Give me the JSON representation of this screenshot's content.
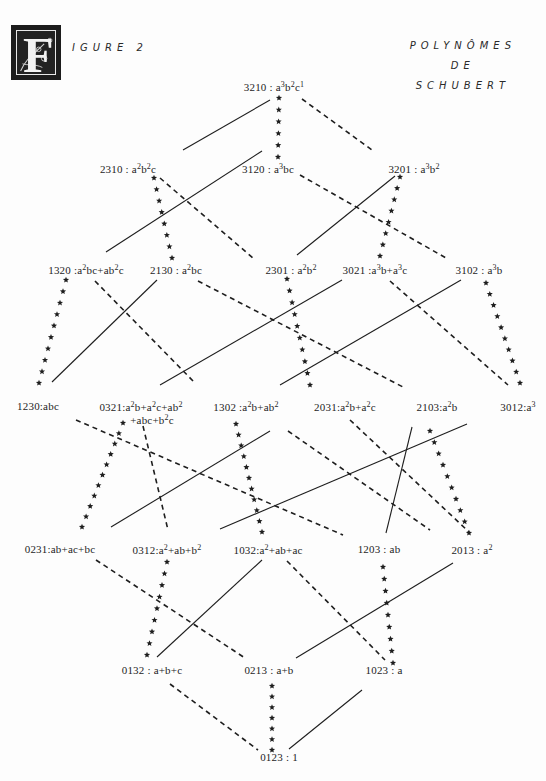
{
  "header": {
    "drop_cap_letter": "F",
    "figure_label": "IGURE  2",
    "title_lines": [
      "POLYNÔMES",
      "DE",
      "SCHUBERT"
    ]
  },
  "colors": {
    "ink": "#1e1e1e",
    "background": "#fdfdfd"
  },
  "nodes": [
    {
      "id": "3210",
      "x": 274,
      "y": 86,
      "html": "3210 : a<sup>3</sup>b<sup>2</sup>c<sup>1</sup>"
    },
    {
      "id": "2310",
      "x": 128,
      "y": 168,
      "html": "2310 : a<sup>2</sup>b<sup>2</sup>c"
    },
    {
      "id": "3120",
      "x": 268,
      "y": 168,
      "html": "3120 : a<sup>3</sup>bc"
    },
    {
      "id": "3201",
      "x": 414,
      "y": 168,
      "html": "3201 : a<sup>3</sup>b<sup>2</sup>"
    },
    {
      "id": "1320",
      "x": 86,
      "y": 269,
      "html": "1320 :a<sup>2</sup>bc+ab<sup>2</sup>c"
    },
    {
      "id": "2130",
      "x": 176,
      "y": 269,
      "html": "2130 : a<sup>2</sup>bc"
    },
    {
      "id": "2301",
      "x": 291,
      "y": 269,
      "html": "2301 : a<sup>2</sup>b<sup>2</sup>"
    },
    {
      "id": "3021",
      "x": 375,
      "y": 269,
      "html": "3021 :a<sup>3</sup>b+a<sup>3</sup>c"
    },
    {
      "id": "3102",
      "x": 479,
      "y": 269,
      "html": "3102 : a<sup>3</sup>b"
    },
    {
      "id": "1230",
      "x": 38,
      "y": 406,
      "html": "1230:abc"
    },
    {
      "id": "0321",
      "x": 141,
      "y": 406,
      "html": "0321:a<sup>2</sup>b+a<sup>2</sup>c+ab<sup>2</sup><span class=\"line2\">+abc+b<sup>2</sup>c</span>",
      "multiline": true
    },
    {
      "id": "1302",
      "x": 246,
      "y": 406,
      "html": "1302 :a<sup>2</sup>b+ab<sup>2</sup>"
    },
    {
      "id": "2031",
      "x": 345,
      "y": 406,
      "html": "2031:a<sup>2</sup>b+a<sup>2</sup>c"
    },
    {
      "id": "2103",
      "x": 437,
      "y": 406,
      "html": "2103:a<sup>2</sup>b"
    },
    {
      "id": "3012",
      "x": 518,
      "y": 406,
      "html": "3012:a<sup>3</sup>"
    },
    {
      "id": "0231",
      "x": 60,
      "y": 549,
      "html": "0231:ab+ac+bc"
    },
    {
      "id": "0312",
      "x": 167,
      "y": 549,
      "html": "0312:a<sup>2</sup>+ab+b<sup>2</sup>"
    },
    {
      "id": "1032",
      "x": 268,
      "y": 549,
      "html": "1032:a<sup>2</sup>+ab+ac"
    },
    {
      "id": "1203",
      "x": 379,
      "y": 549,
      "html": "1203 : ab"
    },
    {
      "id": "2013",
      "x": 472,
      "y": 549,
      "html": "2013 : a<sup>2</sup>"
    },
    {
      "id": "0132",
      "x": 152,
      "y": 670,
      "html": "0132 : a+b+c"
    },
    {
      "id": "0213",
      "x": 269,
      "y": 670,
      "html": "0213 : a+b"
    },
    {
      "id": "1023",
      "x": 384,
      "y": 670,
      "html": "1023 : a"
    },
    {
      "id": "0123",
      "x": 279,
      "y": 757,
      "html": "0123 : 1"
    }
  ],
  "edges": [
    {
      "type": "solid",
      "x1": 270,
      "y1": 100,
      "x2": 183,
      "y2": 150
    },
    {
      "type": "stars",
      "x1": 279,
      "y1": 98,
      "x2": 278,
      "y2": 157
    },
    {
      "type": "dashed",
      "x1": 302,
      "y1": 99,
      "x2": 372,
      "y2": 150
    },
    {
      "type": "stars",
      "x1": 154,
      "y1": 178,
      "x2": 172,
      "y2": 258
    },
    {
      "type": "dashed",
      "x1": 160,
      "y1": 178,
      "x2": 253,
      "y2": 258
    },
    {
      "type": "solid",
      "x1": 262,
      "y1": 151,
      "x2": 106,
      "y2": 252
    },
    {
      "type": "dashed",
      "x1": 300,
      "y1": 175,
      "x2": 446,
      "y2": 258
    },
    {
      "type": "solid",
      "x1": 395,
      "y1": 176,
      "x2": 297,
      "y2": 255
    },
    {
      "type": "stars",
      "x1": 400,
      "y1": 177,
      "x2": 380,
      "y2": 256
    },
    {
      "type": "stars",
      "x1": 66,
      "y1": 280,
      "x2": 39,
      "y2": 383
    },
    {
      "type": "dashed",
      "x1": 95,
      "y1": 281,
      "x2": 195,
      "y2": 383
    },
    {
      "type": "solid",
      "x1": 157,
      "y1": 280,
      "x2": 52,
      "y2": 382
    },
    {
      "type": "dashed",
      "x1": 198,
      "y1": 281,
      "x2": 403,
      "y2": 387
    },
    {
      "type": "stars",
      "x1": 287,
      "y1": 279,
      "x2": 310,
      "y2": 385
    },
    {
      "type": "solid",
      "x1": 342,
      "y1": 280,
      "x2": 160,
      "y2": 385
    },
    {
      "type": "dashed",
      "x1": 390,
      "y1": 281,
      "x2": 508,
      "y2": 385
    },
    {
      "type": "solid",
      "x1": 461,
      "y1": 280,
      "x2": 280,
      "y2": 385
    },
    {
      "type": "stars",
      "x1": 486,
      "y1": 283,
      "x2": 520,
      "y2": 383
    },
    {
      "type": "dashed",
      "x1": 76,
      "y1": 420,
      "x2": 343,
      "y2": 535
    },
    {
      "type": "stars",
      "x1": 123,
      "y1": 423,
      "x2": 82,
      "y2": 527
    },
    {
      "type": "dashed",
      "x1": 143,
      "y1": 426,
      "x2": 168,
      "y2": 530
    },
    {
      "type": "solid",
      "x1": 111,
      "y1": 527,
      "x2": 270,
      "y2": 431
    },
    {
      "type": "stars",
      "x1": 236,
      "y1": 424,
      "x2": 262,
      "y2": 532
    },
    {
      "type": "dashed",
      "x1": 350,
      "y1": 420,
      "x2": 469,
      "y2": 532
    },
    {
      "type": "solid",
      "x1": 220,
      "y1": 529,
      "x2": 467,
      "y2": 424
    },
    {
      "type": "solid",
      "x1": 412,
      "y1": 427,
      "x2": 386,
      "y2": 533
    },
    {
      "type": "stars",
      "x1": 430,
      "y1": 431,
      "x2": 469,
      "y2": 533
    },
    {
      "type": "dashed",
      "x1": 288,
      "y1": 431,
      "x2": 430,
      "y2": 530
    },
    {
      "type": "dashed",
      "x1": 96,
      "y1": 560,
      "x2": 245,
      "y2": 658
    },
    {
      "type": "stars",
      "x1": 167,
      "y1": 562,
      "x2": 147,
      "y2": 655
    },
    {
      "type": "solid",
      "x1": 262,
      "y1": 560,
      "x2": 157,
      "y2": 657
    },
    {
      "type": "dashed",
      "x1": 287,
      "y1": 561,
      "x2": 385,
      "y2": 660
    },
    {
      "type": "stars",
      "x1": 383,
      "y1": 567,
      "x2": 393,
      "y2": 663
    },
    {
      "type": "solid",
      "x1": 453,
      "y1": 563,
      "x2": 296,
      "y2": 658
    },
    {
      "type": "dashed",
      "x1": 170,
      "y1": 684,
      "x2": 258,
      "y2": 750
    },
    {
      "type": "stars",
      "x1": 272,
      "y1": 686,
      "x2": 272,
      "y2": 750
    },
    {
      "type": "solid",
      "x1": 362,
      "y1": 690,
      "x2": 289,
      "y2": 749
    }
  ]
}
